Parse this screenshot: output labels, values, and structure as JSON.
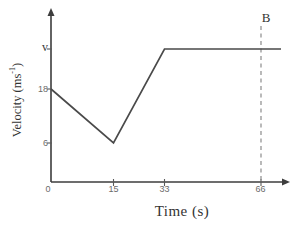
{
  "chart_data": {
    "type": "line",
    "title": "",
    "xlabel": "Time (s)",
    "ylabel": "Velocity (ms⁻¹)",
    "ylabel_parts": {
      "pre": "Velocity (ms",
      "sup": "-1",
      "post": ")"
    },
    "x_ticks": [
      "0",
      "15",
      "33",
      "66"
    ],
    "y_ticks": [
      "v",
      "18",
      "6"
    ],
    "xlim": [
      0,
      72
    ],
    "grid": false,
    "series": [
      {
        "name": "velocity",
        "points": [
          {
            "t": 0,
            "v": 18
          },
          {
            "t": 15,
            "v": 6
          },
          {
            "t": 33,
            "v": "v"
          },
          {
            "t": 66,
            "v": "v"
          }
        ]
      }
    ],
    "annotations": [
      {
        "label": "B",
        "x": 66,
        "style": "dashed-vertical-line"
      }
    ]
  }
}
